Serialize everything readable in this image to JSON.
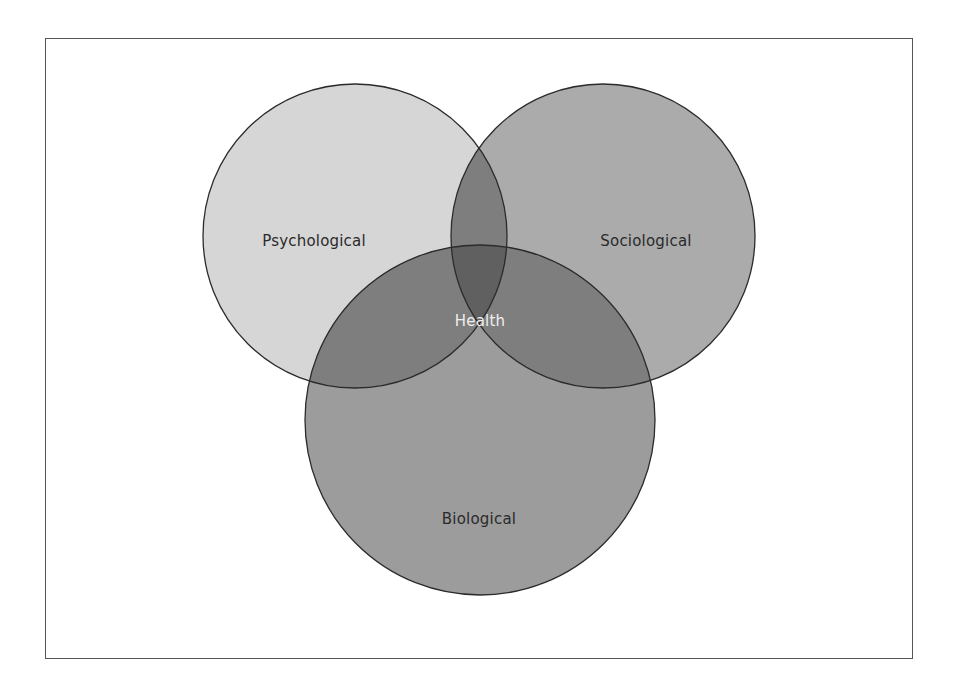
{
  "diagram": {
    "type": "venn",
    "sets": [
      {
        "id": "psychological",
        "label": "Psychological",
        "cx": 355,
        "cy": 236,
        "r": 152,
        "fill": "#d6d6d6"
      },
      {
        "id": "sociological",
        "label": "Sociological",
        "cx": 603,
        "cy": 236,
        "r": 152,
        "fill": "#ababab"
      },
      {
        "id": "biological",
        "label": "Biological",
        "cx": 480,
        "cy": 420,
        "r": 175,
        "fill": "#9c9c9c"
      }
    ],
    "center_label": "Health",
    "stroke_color": "#2b2b2b",
    "overlap_two_color": "#7e7e7e",
    "overlap_three_color": "#606060"
  }
}
